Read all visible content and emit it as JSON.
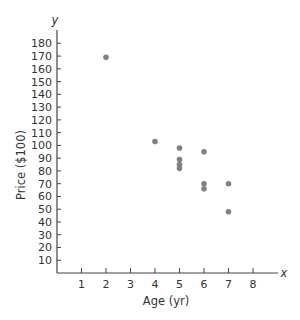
{
  "chart_data": {
    "type": "scatter",
    "title": "",
    "xlabel": "Age (yr)",
    "ylabel": "Price ($100)",
    "x_axis_var": "x",
    "y_axis_var": "y",
    "xlim": [
      0,
      9
    ],
    "ylim": [
      0,
      190
    ],
    "xticks": [
      1,
      2,
      3,
      4,
      5,
      6,
      7,
      8
    ],
    "yticks": [
      10,
      20,
      30,
      40,
      50,
      60,
      70,
      80,
      90,
      100,
      110,
      120,
      130,
      140,
      150,
      160,
      170,
      180
    ],
    "grid": false,
    "legend": null,
    "series": [
      {
        "name": "cars",
        "color": "#808080",
        "points": [
          {
            "x": 2,
            "y": 169
          },
          {
            "x": 4,
            "y": 103
          },
          {
            "x": 5,
            "y": 98
          },
          {
            "x": 5,
            "y": 89
          },
          {
            "x": 5,
            "y": 85
          },
          {
            "x": 5,
            "y": 82
          },
          {
            "x": 6,
            "y": 95
          },
          {
            "x": 6,
            "y": 70
          },
          {
            "x": 6,
            "y": 66
          },
          {
            "x": 7,
            "y": 70
          },
          {
            "x": 7,
            "y": 48
          }
        ]
      }
    ]
  },
  "colors": {
    "axis": "#444444",
    "text": "#333333",
    "point": "#808080"
  }
}
